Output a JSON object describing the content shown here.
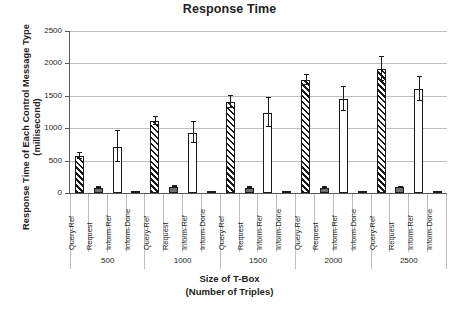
{
  "chart_data": {
    "type": "bar",
    "title": "Response Time",
    "ylabel_line1": "Response Time of Each Control Message Type",
    "ylabel_line2": "(millisecond)",
    "xlabel_line1": "Size of T-Box",
    "xlabel_line2": "(Number of Triples)",
    "ylim": [
      0,
      2500
    ],
    "yticks": [
      0,
      500,
      1000,
      1500,
      2000,
      2500
    ],
    "ytick_labels": [
      "0",
      "500",
      "1000",
      "1500",
      "2000",
      "2500"
    ],
    "grid": true,
    "legend": "none",
    "categories": [
      "500",
      "1000",
      "1500",
      "2000",
      "2500"
    ],
    "subcategories": [
      "Query-Ref",
      "Request",
      "Inform-Ref",
      "Inform-Done"
    ],
    "series": [
      {
        "name": "Query-Ref",
        "style": "hatched",
        "values": [
          565,
          1115,
          1405,
          1740,
          1920
        ],
        "errors": [
          45,
          60,
          90,
          80,
          185
        ]
      },
      {
        "name": "Request",
        "style": "solid-gray",
        "values": [
          80,
          100,
          85,
          80,
          90
        ],
        "errors": [
          8,
          10,
          8,
          8,
          8
        ]
      },
      {
        "name": "Inform-Ref",
        "style": "open-white",
        "values": [
          715,
          930,
          1240,
          1450,
          1605
        ],
        "errors": [
          235,
          165,
          225,
          190,
          190
        ]
      },
      {
        "name": "Inform-Done",
        "style": "solid-gray",
        "values": [
          15,
          15,
          18,
          13,
          12
        ],
        "errors": [
          4,
          4,
          4,
          3,
          3
        ]
      }
    ],
    "colors": {
      "bar_outline": "#1a1a1a",
      "solid_fill": "#6d6e71",
      "open_fill": "#ffffff",
      "gridline": "#bcbec0",
      "axis": "#58595b",
      "text": "#231f20"
    }
  }
}
